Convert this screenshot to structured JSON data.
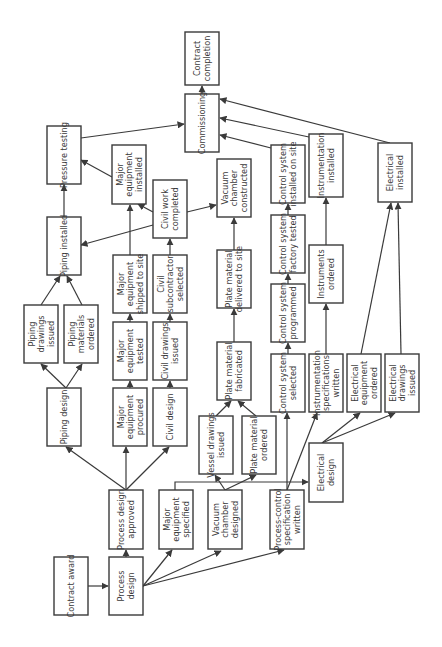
{
  "colors": {
    "stroke": "#3a3a3a",
    "text": "#3a3a3a",
    "background": "#ffffff"
  },
  "nodes": [
    {
      "id": "contract-award",
      "lines": [
        "Contract award"
      ],
      "x": 54,
      "y": 557,
      "w": 34,
      "h": 58
    },
    {
      "id": "process-design",
      "lines": [
        "Process",
        "design"
      ],
      "x": 109,
      "y": 557,
      "w": 34,
      "h": 58
    },
    {
      "id": "process-design-approved",
      "lines": [
        "Process design",
        "approved"
      ],
      "x": 109,
      "y": 490,
      "w": 34,
      "h": 59
    },
    {
      "id": "major-equipment-specified",
      "lines": [
        "Major",
        "equipment",
        "specified"
      ],
      "x": 159,
      "y": 490,
      "w": 34,
      "h": 59
    },
    {
      "id": "vacuum-chamber-designed",
      "lines": [
        "Vacuum",
        "chamber",
        "designed"
      ],
      "x": 208,
      "y": 490,
      "w": 34,
      "h": 59
    },
    {
      "id": "process-control-spec",
      "lines": [
        "Process-control",
        "specification",
        "written"
      ],
      "x": 270,
      "y": 490,
      "w": 34,
      "h": 59
    },
    {
      "id": "electrical-design",
      "lines": [
        "Electrical",
        "design"
      ],
      "x": 309,
      "y": 443,
      "w": 34,
      "h": 59
    },
    {
      "id": "piping-design",
      "lines": [
        "Piping design"
      ],
      "x": 47,
      "y": 388,
      "w": 34,
      "h": 58
    },
    {
      "id": "major-equipment-procured",
      "lines": [
        "Major",
        "equipment",
        "procured"
      ],
      "x": 113,
      "y": 388,
      "w": 34,
      "h": 58
    },
    {
      "id": "civil-design",
      "lines": [
        "Civil design"
      ],
      "x": 153,
      "y": 388,
      "w": 34,
      "h": 58
    },
    {
      "id": "vessel-drawings-issued",
      "lines": [
        "Vessel drawings",
        "issued"
      ],
      "x": 199,
      "y": 416,
      "w": 34,
      "h": 58
    },
    {
      "id": "plate-material-ordered",
      "lines": [
        "Plate material",
        "ordered"
      ],
      "x": 242,
      "y": 416,
      "w": 34,
      "h": 58
    },
    {
      "id": "plate-material-fabricated",
      "lines": [
        "Plate material",
        "fabricated"
      ],
      "x": 217,
      "y": 342,
      "w": 34,
      "h": 58
    },
    {
      "id": "control-system-selected",
      "lines": [
        "Control system",
        "selected"
      ],
      "x": 271,
      "y": 354,
      "w": 34,
      "h": 58
    },
    {
      "id": "instrumentation-specs",
      "lines": [
        "Instrumentation",
        "specifications",
        "written"
      ],
      "x": 309,
      "y": 354,
      "w": 34,
      "h": 58
    },
    {
      "id": "electrical-equipment-ordered",
      "lines": [
        "Electrical",
        "equipment",
        "ordered"
      ],
      "x": 347,
      "y": 354,
      "w": 34,
      "h": 58
    },
    {
      "id": "electrical-drawings-issued",
      "lines": [
        "Electrical",
        "drawings",
        "issued"
      ],
      "x": 385,
      "y": 354,
      "w": 34,
      "h": 58
    },
    {
      "id": "piping-drawings-issued",
      "lines": [
        "Piping",
        "drawings",
        "issued"
      ],
      "x": 24,
      "y": 305,
      "w": 34,
      "h": 58
    },
    {
      "id": "piping-materials-ordered",
      "lines": [
        "Piping",
        "materials",
        "ordered"
      ],
      "x": 64,
      "y": 305,
      "w": 34,
      "h": 58
    },
    {
      "id": "major-equipment-tested",
      "lines": [
        "Major",
        "equipment",
        "tested"
      ],
      "x": 113,
      "y": 322,
      "w": 34,
      "h": 58
    },
    {
      "id": "civil-drawings-issued",
      "lines": [
        "Civil drawings",
        "issued"
      ],
      "x": 153,
      "y": 322,
      "w": 34,
      "h": 58
    },
    {
      "id": "control-system-programmed",
      "lines": [
        "Control system",
        "programmed"
      ],
      "x": 271,
      "y": 284,
      "w": 34,
      "h": 58
    },
    {
      "id": "instruments-ordered",
      "lines": [
        "Instruments",
        "ordered"
      ],
      "x": 309,
      "y": 245,
      "w": 34,
      "h": 58
    },
    {
      "id": "major-equipment-shipped",
      "lines": [
        "Major",
        "equipment",
        "shipped to site"
      ],
      "x": 113,
      "y": 255,
      "w": 34,
      "h": 58
    },
    {
      "id": "civil-subcontractor-selected",
      "lines": [
        "Civil",
        "subcontractor",
        "selected"
      ],
      "x": 153,
      "y": 255,
      "w": 34,
      "h": 58
    },
    {
      "id": "plate-material-delivered",
      "lines": [
        "Plate material",
        "delivered to site"
      ],
      "x": 217,
      "y": 250,
      "w": 34,
      "h": 58
    },
    {
      "id": "control-system-factory-tested",
      "lines": [
        "Control system",
        "factory tested"
      ],
      "x": 271,
      "y": 215,
      "w": 34,
      "h": 58
    },
    {
      "id": "piping-installed",
      "lines": [
        "Piping installed"
      ],
      "x": 47,
      "y": 217,
      "w": 34,
      "h": 58
    },
    {
      "id": "pressure-testing",
      "lines": [
        "Pressure testing"
      ],
      "x": 47,
      "y": 126,
      "w": 34,
      "h": 58
    },
    {
      "id": "major-equipment-installed",
      "lines": [
        "Major",
        "equipment",
        "installed"
      ],
      "x": 112,
      "y": 145,
      "w": 34,
      "h": 59
    },
    {
      "id": "civil-work-completed",
      "lines": [
        "Civil work",
        "completed"
      ],
      "x": 153,
      "y": 180,
      "w": 34,
      "h": 58
    },
    {
      "id": "vacuum-chamber-constructed",
      "lines": [
        "Vacuum",
        "chamber",
        "constructed"
      ],
      "x": 217,
      "y": 159,
      "w": 34,
      "h": 58
    },
    {
      "id": "control-system-installed",
      "lines": [
        "Control system",
        "installed on site"
      ],
      "x": 271,
      "y": 145,
      "w": 34,
      "h": 58
    },
    {
      "id": "instrumentation-installed",
      "lines": [
        "Instrumentation",
        "installed"
      ],
      "x": 309,
      "y": 134,
      "w": 34,
      "h": 63
    },
    {
      "id": "electrical-installed",
      "lines": [
        "Electrical",
        "installed"
      ],
      "x": 378,
      "y": 143,
      "w": 34,
      "h": 59
    },
    {
      "id": "commissioning",
      "lines": [
        "Commissioning"
      ],
      "x": 185,
      "y": 94,
      "w": 34,
      "h": 58
    },
    {
      "id": "contract-completion",
      "lines": [
        "Contract",
        "completion"
      ],
      "x": 185,
      "y": 32,
      "w": 34,
      "h": 53
    }
  ],
  "edges": [
    {
      "from": [
        88,
        586
      ],
      "to": [
        108,
        586
      ]
    },
    {
      "from": [
        126,
        557
      ],
      "to": [
        126,
        550
      ]
    },
    {
      "from": [
        143,
        586
      ],
      "to": [
        172,
        550
      ]
    },
    {
      "from": [
        143,
        586
      ],
      "to": [
        221,
        551
      ]
    },
    {
      "from": [
        143,
        586
      ],
      "to": [
        284,
        550
      ]
    },
    {
      "from": [
        126,
        490
      ],
      "to": [
        66,
        447
      ]
    },
    {
      "from": [
        126,
        490
      ],
      "to": [
        126,
        447
      ]
    },
    {
      "from": [
        126,
        490
      ],
      "to": [
        169,
        447
      ]
    },
    {
      "from": [
        175,
        490
      ],
      "path": [
        [
          175,
          482
        ],
        [
          308,
          482
        ]
      ]
    },
    {
      "from": [
        225,
        490
      ],
      "to": [
        215,
        475
      ]
    },
    {
      "from": [
        225,
        490
      ],
      "to": [
        256,
        475
      ]
    },
    {
      "from": [
        216,
        416
      ],
      "to": [
        231,
        401
      ]
    },
    {
      "from": [
        256,
        416
      ],
      "to": [
        238,
        401
      ]
    },
    {
      "from": [
        287,
        490
      ],
      "to": [
        287,
        413
      ]
    },
    {
      "from": [
        287,
        490
      ],
      "to": [
        317,
        413
      ]
    },
    {
      "from": [
        322,
        443
      ],
      "to": [
        360,
        413
      ]
    },
    {
      "from": [
        322,
        443
      ],
      "to": [
        395,
        413
      ]
    },
    {
      "from": [
        66,
        388
      ],
      "to": [
        41,
        364
      ]
    },
    {
      "from": [
        66,
        388
      ],
      "to": [
        82,
        364
      ]
    },
    {
      "from": [
        41,
        305
      ],
      "to": [
        60,
        276
      ]
    },
    {
      "from": [
        82,
        305
      ],
      "to": [
        67,
        276
      ]
    },
    {
      "from": [
        130,
        388
      ],
      "to": [
        130,
        381
      ]
    },
    {
      "from": [
        130,
        322
      ],
      "to": [
        130,
        314
      ]
    },
    {
      "from": [
        170,
        388
      ],
      "to": [
        170,
        381
      ]
    },
    {
      "from": [
        170,
        322
      ],
      "to": [
        170,
        314
      ]
    },
    {
      "from": [
        234,
        342
      ],
      "to": [
        234,
        309
      ]
    },
    {
      "from": [
        288,
        354
      ],
      "to": [
        288,
        343
      ]
    },
    {
      "from": [
        288,
        284
      ],
      "to": [
        288,
        274
      ]
    },
    {
      "from": [
        288,
        215
      ],
      "to": [
        288,
        204
      ]
    },
    {
      "from": [
        326,
        354
      ],
      "to": [
        326,
        304
      ]
    },
    {
      "from": [
        326,
        245
      ],
      "to": [
        326,
        198
      ]
    },
    {
      "from": [
        361,
        354
      ],
      "to": [
        391,
        203
      ]
    },
    {
      "from": [
        401,
        354
      ],
      "to": [
        398,
        203
      ]
    },
    {
      "from": [
        130,
        255
      ],
      "to": [
        130,
        205
      ]
    },
    {
      "from": [
        170,
        255
      ],
      "to": [
        170,
        239
      ]
    },
    {
      "from": [
        234,
        250
      ],
      "to": [
        234,
        218
      ]
    },
    {
      "from": [
        153,
        225
      ],
      "to": [
        81,
        245
      ]
    },
    {
      "from": [
        153,
        212
      ],
      "to": [
        138,
        204
      ]
    },
    {
      "from": [
        187,
        212
      ],
      "to": [
        216,
        205
      ]
    },
    {
      "from": [
        64,
        217
      ],
      "to": [
        64,
        185
      ]
    },
    {
      "from": [
        112,
        177
      ],
      "to": [
        81,
        160
      ]
    },
    {
      "from": [
        81,
        138
      ],
      "to": [
        184,
        124
      ]
    },
    {
      "from": [
        271,
        148
      ],
      "to": [
        220,
        135
      ]
    },
    {
      "from": [
        309,
        137
      ],
      "to": [
        220,
        118
      ]
    },
    {
      "from": [
        390,
        143
      ],
      "to": [
        220,
        99
      ]
    },
    {
      "from": [
        202,
        94
      ],
      "to": [
        202,
        86
      ]
    }
  ]
}
